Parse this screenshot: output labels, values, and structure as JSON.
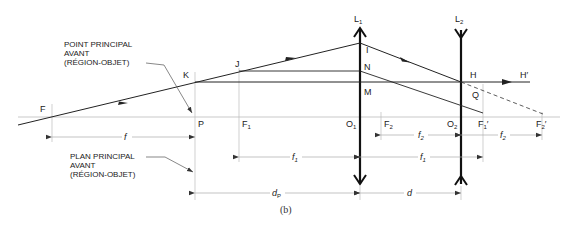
{
  "diagram": {
    "caption": "(b)",
    "notes": {
      "point_principal": "POINT PRINCIPAL\nAVANT\n(RÉGION-OBJET)",
      "plan_principal": "PLAN PRINCIPAL\nAVANT\n(RÉGION-OBJET)"
    },
    "lenses": {
      "L1": {
        "name": "L",
        "sub": "1"
      },
      "L2": {
        "name": "L",
        "sub": "2"
      }
    },
    "points": {
      "F": "F",
      "K": "K",
      "J": "J",
      "I": "I",
      "N": "N",
      "M": "M",
      "H": "H",
      "H_prime": "H′",
      "Q": "Q",
      "P": "P",
      "F1": {
        "name": "F",
        "sub": "1"
      },
      "O1": {
        "name": "O",
        "sub": "1"
      },
      "F2": {
        "name": "F",
        "sub": "2"
      },
      "O2": {
        "name": "O",
        "sub": "2"
      },
      "F1_prime": {
        "name": "F",
        "sub": "1",
        "prime": "′"
      },
      "F2_prime": {
        "name": "F",
        "sub": "2",
        "prime": "′"
      }
    },
    "dimensions": {
      "f": "f",
      "f1_left": {
        "name": "f",
        "sub": "1"
      },
      "f1_right": {
        "name": "f",
        "sub": "1"
      },
      "f2_left": {
        "name": "f",
        "sub": "2"
      },
      "f2_right": {
        "name": "f",
        "sub": "2"
      },
      "dP": {
        "name": "d",
        "sub": "P"
      },
      "d": "d"
    }
  }
}
